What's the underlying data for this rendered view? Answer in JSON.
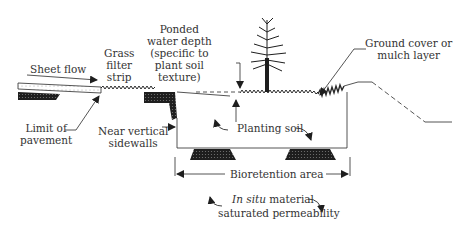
{
  "labels": {
    "sheet_flow": "Sheet flow",
    "grass_filter_strip": [
      "Grass",
      "filter",
      "strip"
    ],
    "ponded_water_depth": [
      "Ponded",
      "water depth",
      "(specific to",
      "plant soil",
      "texture)"
    ],
    "ground_cover": [
      "Ground cover or",
      "mulch layer"
    ],
    "limit_of_pavement": [
      "Limit of",
      "pavement"
    ],
    "near_vertical_sidewalls": [
      "Near vertical",
      "sidewalls"
    ],
    "planting_soil": "Planting soil",
    "bioretention_area": "Bioretention area",
    "in_situ_italic": "In situ",
    "in_situ_rest": " material",
    "saturated_permeability": "saturated permeability"
  },
  "colors": {
    "line": "#2a2a2a",
    "fill_dark": "#1e1e1e",
    "background": "#ffffff"
  }
}
